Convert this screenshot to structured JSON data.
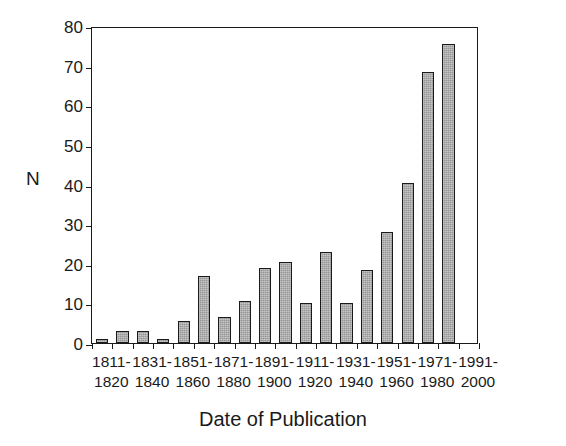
{
  "chart_data": {
    "type": "bar",
    "title": "",
    "xlabel": "Date of Publication",
    "ylabel": "N",
    "ylim": [
      0,
      80
    ],
    "yticks": [
      0,
      10,
      20,
      30,
      40,
      50,
      60,
      70,
      80
    ],
    "grid": false,
    "legend": null,
    "categories": [
      "1811-1820",
      "1821-1830",
      "1831-1840",
      "1841-1850",
      "1851-1860",
      "1861-1870",
      "1871-1880",
      "1881-1890",
      "1891-1900",
      "1901-1910",
      "1911-1920",
      "1921-1930",
      "1931-1940",
      "1941-1950",
      "1951-1960",
      "1961-1970",
      "1971-1980",
      "1981-1990",
      "1991-2000"
    ],
    "values": [
      1,
      3,
      3,
      1,
      5.5,
      17,
      6.5,
      10.5,
      19,
      20.5,
      10,
      23,
      10,
      18.5,
      28,
      40.5,
      68.5,
      75.5,
      0
    ],
    "bars": [
      {
        "label": "1811-1820",
        "value": 1
      },
      {
        "label": "1821-1830",
        "value": 3
      },
      {
        "label": "1831-1840",
        "value": 3
      },
      {
        "label": "1841-1850",
        "value": 1
      },
      {
        "label": "1851-1860",
        "value": 5.5
      },
      {
        "label": "1861-1870",
        "value": 17
      },
      {
        "label": "1871-1880",
        "value": 6.5
      },
      {
        "label": "1881-1890",
        "value": 10.5
      },
      {
        "label": "1891-1900",
        "value": 19
      },
      {
        "label": "1901-1910",
        "value": 20.5
      },
      {
        "label": "1911-1920",
        "value": 10
      },
      {
        "label": "1921-1930",
        "value": 23
      },
      {
        "label": "1931-1940",
        "value": 10
      },
      {
        "label": "1941-1950",
        "value": 18.5
      },
      {
        "label": "1951-1960",
        "value": 28
      },
      {
        "label": "1961-1970",
        "value": 40.5
      },
      {
        "label": "1971-1980",
        "value": 68.5
      },
      {
        "label": "1981-1990",
        "value": 75.5
      }
    ],
    "xtick_labels": [
      {
        "line1": "1811-",
        "line2": "1820"
      },
      {
        "line1": "1831-",
        "line2": "1840"
      },
      {
        "line1": "1851-",
        "line2": "1860"
      },
      {
        "line1": "1871-",
        "line2": "1880"
      },
      {
        "line1": "1891-",
        "line2": "1900"
      },
      {
        "line1": "1911-",
        "line2": "1920"
      },
      {
        "line1": "1931-",
        "line2": "1940"
      },
      {
        "line1": "1951-",
        "line2": "1960"
      },
      {
        "line1": "1971-",
        "line2": "1980"
      },
      {
        "line1": "1991-",
        "line2": "2000"
      }
    ],
    "colors": {
      "bar_fill": "#969696",
      "bar_edge": "#1a1a1a",
      "axis": "#1a1a1a",
      "background": "#ffffff",
      "text": "#1a1a1a"
    }
  }
}
